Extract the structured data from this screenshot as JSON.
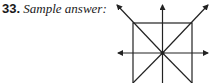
{
  "problem": {
    "number": "33.",
    "caption": " Sample answer:"
  },
  "diagram": {
    "stroke_color": "#222222",
    "elements": [
      "square",
      "vertical-line",
      "horizontal-line",
      "diagonal-line-1",
      "diagonal-line-2",
      "center-point"
    ]
  }
}
